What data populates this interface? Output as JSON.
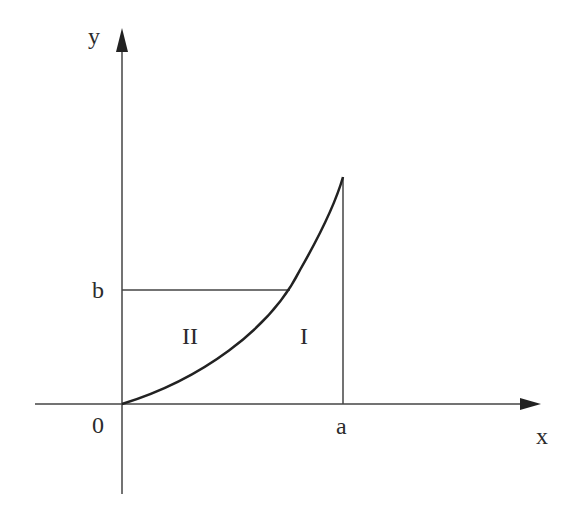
{
  "diagram": {
    "type": "area-under-curve",
    "axes": {
      "x_label": "x",
      "y_label": "y",
      "origin_label": "0"
    },
    "marks": {
      "x_mark": "a",
      "y_mark": "b"
    },
    "regions": {
      "region_under_curve": "I",
      "region_left_of_curve": "II"
    },
    "colors": {
      "stroke": "#2b2b2b",
      "background": "#ffffff"
    }
  }
}
